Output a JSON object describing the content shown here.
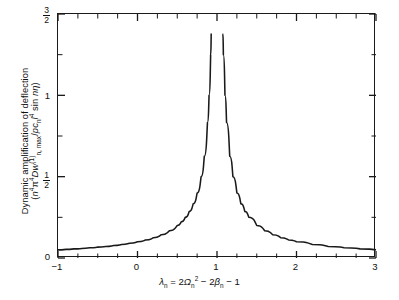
{
  "chart_data": {
    "type": "line",
    "title": "",
    "subtitle": "",
    "xlabel_plain": "lambda_n = 2*Omega_n^2 - 2*beta_n - 1",
    "ylabel_plain": "Dynamic amplification of deflection (n^4 pi^4 D w_(n,max)^(1) / p c_n l^4 sin n eta)",
    "ylabel_line1": "Dynamic amplification of deflection",
    "xlim": [
      -1,
      3
    ],
    "ylim": [
      0,
      1.5
    ],
    "grid": false,
    "legend": null,
    "xticks": [
      -1,
      0,
      1,
      2,
      3
    ],
    "xticklabels": [
      "−1",
      "0",
      "1",
      "2",
      "3"
    ],
    "xminor_step": 0.25,
    "yticks": [
      0,
      0.5,
      1,
      1.5
    ],
    "yticklabels": [
      "0",
      "1/2",
      "1",
      "3/2"
    ],
    "yminor_step": 0.25,
    "asymptote_x": 1,
    "curve_clip_top": 1.38,
    "series": [
      {
        "name": "Dynamic amplification",
        "formula": "y = 0.10 / |lambda_n - 1|",
        "x": [
          -1.0,
          -0.9,
          -0.8,
          -0.7,
          -0.6,
          -0.5,
          -0.4,
          -0.3,
          -0.2,
          -0.1,
          0.0,
          0.1,
          0.2,
          0.3,
          0.4,
          0.5,
          0.55,
          0.6,
          0.65,
          0.7,
          0.75,
          0.8,
          0.84,
          0.88,
          0.9,
          0.92,
          0.927,
          1.073,
          1.08,
          1.1,
          1.12,
          1.16,
          1.2,
          1.25,
          1.3,
          1.35,
          1.4,
          1.5,
          1.6,
          1.7,
          1.8,
          1.9,
          2.0,
          2.2,
          2.4,
          2.6,
          2.8,
          3.0
        ],
        "y": [
          0.05,
          0.053,
          0.056,
          0.059,
          0.063,
          0.067,
          0.071,
          0.077,
          0.083,
          0.091,
          0.1,
          0.111,
          0.125,
          0.143,
          0.167,
          0.2,
          0.222,
          0.25,
          0.286,
          0.333,
          0.4,
          0.5,
          0.625,
          0.833,
          1.0,
          1.25,
          1.38,
          1.38,
          1.25,
          1.0,
          0.833,
          0.625,
          0.5,
          0.4,
          0.333,
          0.286,
          0.25,
          0.2,
          0.167,
          0.143,
          0.125,
          0.111,
          0.1,
          0.083,
          0.071,
          0.063,
          0.056,
          0.05
        ]
      }
    ]
  },
  "axis": {
    "xticklabels": [
      "−1",
      "0",
      "1",
      "2",
      "3"
    ],
    "ytick_0": "0",
    "ytick_half_num": "1",
    "ytick_half_den": "2",
    "ytick_1": "1",
    "ytick_threehalf_num": "3",
    "ytick_threehalf_den": "2"
  },
  "labels": {
    "ylabel_line1": "Dynamic amplification of deflection",
    "ylabel_l2_a": "(",
    "ylabel_l2_n": "n",
    "ylabel_l2_n_sup": "4",
    "ylabel_l2_pi": "π",
    "ylabel_l2_pi_sup": "4",
    "ylabel_l2_D": "D",
    "ylabel_l2_w": "w",
    "ylabel_l2_w_sup": "(1)",
    "ylabel_l2_w_sub": "n, max",
    "ylabel_l2_slash": "/",
    "ylabel_l2_p": "p",
    "ylabel_l2_c": "c",
    "ylabel_l2_c_sub": "n",
    "ylabel_l2_l": "l",
    "ylabel_l2_l_sup": "4",
    "ylabel_l2_sin": " sin ",
    "ylabel_l2_n2": "n",
    "ylabel_l2_eta": "η",
    "ylabel_l2_close": ")",
    "xlabel_lambda": "λ",
    "xlabel_lambda_sub": "n",
    "xlabel_eq": " = 2",
    "xlabel_omega": "Ω",
    "xlabel_omega_sub": "n",
    "xlabel_omega_sup": "2",
    "xlabel_minus1": " − 2",
    "xlabel_beta": "β",
    "xlabel_beta_sub": "n",
    "xlabel_minus2": " − 1"
  },
  "colors": {
    "curve": "#1a1a1a",
    "axis": "#1a1a1a",
    "background": "#ffffff",
    "text": "#111111"
  }
}
